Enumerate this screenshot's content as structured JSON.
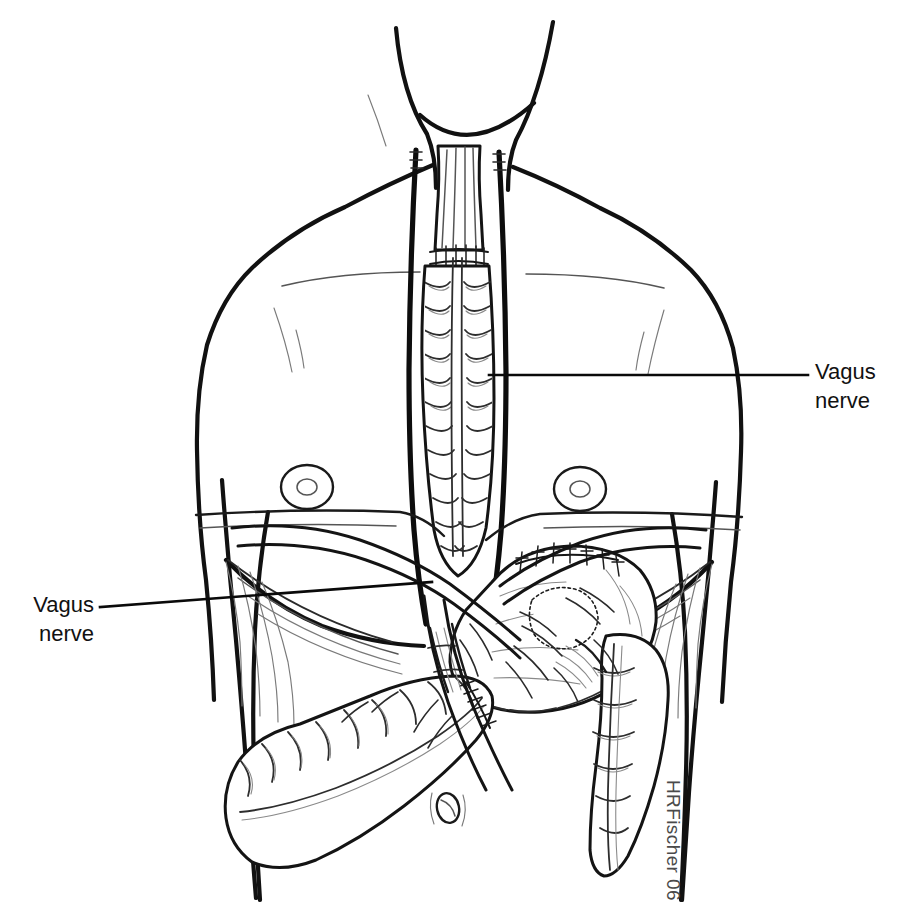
{
  "figure": {
    "domain": "Diagram",
    "background_color": "#ffffff",
    "line_color": "#111111",
    "width": 897,
    "height": 913
  },
  "labels": [
    {
      "id": "label-right",
      "line1": "Vagus",
      "line2": "nerve",
      "text_x": 815,
      "text_y_line1": 379,
      "text_y_line2": 408,
      "leader": {
        "x1": 489,
        "y1": 375,
        "x2": 808,
        "y2": 375
      },
      "anchor": "start",
      "points_to": "right-vagus-trunk-thorax"
    },
    {
      "id": "label-left",
      "line1": "Vagus",
      "line2": "nerve",
      "text_x": 94,
      "text_y_line1": 612,
      "text_y_line2": 641,
      "leader": {
        "x1": 100,
        "y1": 607,
        "x2": 430,
        "y2": 582
      },
      "anchor": "end",
      "points_to": "left-vagus-branch-abdomen"
    }
  ],
  "signature": {
    "text": "HRFischer 06",
    "x": 667,
    "y": 780,
    "rotation": 90,
    "color": "#4a4a4a"
  },
  "anatomy": {
    "structures": [
      {
        "name": "neck",
        "type": "body-outline"
      },
      {
        "name": "shoulders",
        "type": "body-outline"
      },
      {
        "name": "left-arm",
        "type": "body-outline"
      },
      {
        "name": "right-arm",
        "type": "body-outline"
      },
      {
        "name": "torso",
        "type": "body-outline"
      },
      {
        "name": "clavicle-left",
        "type": "contour"
      },
      {
        "name": "clavicle-right",
        "type": "contour"
      },
      {
        "name": "pectoral-left",
        "type": "contour"
      },
      {
        "name": "pectoral-right",
        "type": "contour"
      },
      {
        "name": "nipple-left",
        "type": "contour"
      },
      {
        "name": "nipple-right",
        "type": "contour"
      },
      {
        "name": "costal-margin-left",
        "type": "contour"
      },
      {
        "name": "costal-margin-right",
        "type": "contour"
      },
      {
        "name": "navel",
        "type": "contour"
      },
      {
        "name": "cervical-esophagus",
        "type": "viscus"
      },
      {
        "name": "colon-conduit-retrosternal",
        "type": "viscus"
      },
      {
        "name": "cervical-anastomosis",
        "type": "suture"
      },
      {
        "name": "stomach",
        "type": "viscus"
      },
      {
        "name": "gastric-suture-line",
        "type": "suture"
      },
      {
        "name": "gastrotomy-anastomosis",
        "type": "viscus"
      },
      {
        "name": "transverse-colon",
        "type": "viscus"
      },
      {
        "name": "descending-colon",
        "type": "viscus"
      },
      {
        "name": "colo-colonic-anastomosis",
        "type": "suture"
      },
      {
        "name": "vagus-trunk-left",
        "type": "nerve"
      },
      {
        "name": "vagus-trunk-right",
        "type": "nerve"
      },
      {
        "name": "vagus-branches-abdominal",
        "type": "nerve"
      },
      {
        "name": "mesenteric-pedicle",
        "type": "viscus"
      }
    ]
  }
}
